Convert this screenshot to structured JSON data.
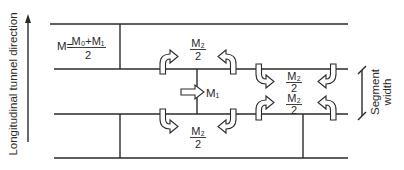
{
  "axis_label": "Longitudinal tunnel direction",
  "segment_label": [
    "Segment",
    "width"
  ],
  "formula": {
    "lhs": "M=",
    "numerator": "M₀+M₁",
    "denominator": "2"
  },
  "labels": {
    "m1": "M₁",
    "m2_half": {
      "numerator": "M₂",
      "denominator": "2"
    }
  },
  "colors": {
    "line": "#2a2a2a",
    "background": "#ffffff"
  }
}
